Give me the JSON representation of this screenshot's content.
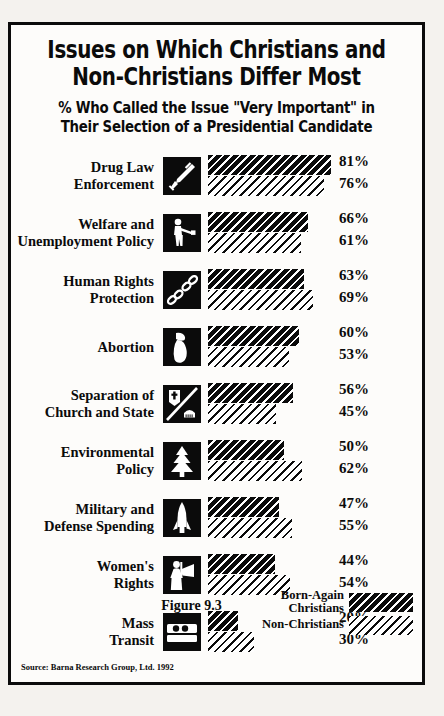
{
  "title": {
    "line1": "Issues on Which Christians and",
    "line2": "Non-Christians Differ Most"
  },
  "subtitle": {
    "line1": "% Who Called the Issue \"Very Important\" in",
    "line2": "Their Selection of a Presidential Candidate"
  },
  "figure_caption": "Figure 9.3",
  "source": "Source: Barna Research Group, Ltd. 1992",
  "legend": {
    "born_again": {
      "line1": "Born-Again",
      "line2": "Christians"
    },
    "non_christians": {
      "line1": "Non-Christians",
      "line2": ""
    }
  },
  "colors": {
    "ink": "#0b0b0b",
    "paper": "#fdfcfa",
    "page": "#f4f2ee"
  },
  "chart_data": {
    "type": "bar",
    "title": "Issues on Which Christians and Non-Christians Differ Most",
    "subtitle": "% Who Called the Issue \"Very Important\" in Their Selection of a Presidential Candidate",
    "xlabel": "",
    "ylabel": "",
    "xlim": [
      0,
      100
    ],
    "grid": false,
    "orientation": "horizontal",
    "legend_position": "bottom-right",
    "unit": "%",
    "source": "Barna Research Group, Ltd. 1992",
    "categories": [
      "Drug Law Enforcement",
      "Welfare and Unemployment Policy",
      "Human Rights Protection",
      "Abortion",
      "Separation of Church and State",
      "Environmental Policy",
      "Military and Defense Spending",
      "Women's Rights",
      "Mass Transit"
    ],
    "series": [
      {
        "name": "Born-Again Christians",
        "values": [
          81,
          66,
          63,
          60,
          56,
          50,
          47,
          44,
          20
        ]
      },
      {
        "name": "Non-Christians",
        "values": [
          76,
          61,
          69,
          53,
          45,
          62,
          55,
          54,
          30
        ]
      }
    ]
  },
  "rows": [
    {
      "label1": "Drug Law",
      "label2": "Enforcement",
      "icon": "syringe-icon",
      "born": "81%",
      "non": "76%"
    },
    {
      "label1": "Welfare and",
      "label2": "Unemployment Policy",
      "icon": "person-handout-icon",
      "born": "66%",
      "non": "61%"
    },
    {
      "label1": "Human Rights",
      "label2": "Protection",
      "icon": "broken-chain-icon",
      "born": "63%",
      "non": "69%"
    },
    {
      "label1": "Abortion",
      "label2": "",
      "icon": "pregnant-woman-icon",
      "born": "60%",
      "non": "53%"
    },
    {
      "label1": "Separation of",
      "label2": "Church and State",
      "icon": "church-state-icon",
      "born": "56%",
      "non": "45%"
    },
    {
      "label1": "Environmental",
      "label2": "Policy",
      "icon": "pine-tree-icon",
      "born": "50%",
      "non": "62%"
    },
    {
      "label1": "Military and",
      "label2": "Defense Spending",
      "icon": "rocket-icon",
      "born": "47%",
      "non": "55%"
    },
    {
      "label1": "Women's",
      "label2": "Rights",
      "icon": "woman-flag-icon",
      "born": "44%",
      "non": "54%"
    },
    {
      "label1": "Mass",
      "label2": "Transit",
      "icon": "bus-icon",
      "born": "20%",
      "non": "30%"
    }
  ]
}
